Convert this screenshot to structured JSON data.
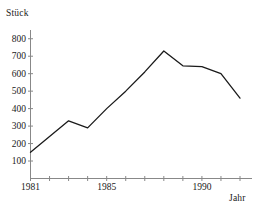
{
  "chart_data": {
    "type": "line",
    "title": "",
    "ylabel": "Stück",
    "xlabel": "Jahr",
    "x": [
      1981,
      1982,
      1983,
      1984,
      1985,
      1986,
      1987,
      1988,
      1989,
      1990,
      1991,
      1992
    ],
    "values": [
      150,
      240,
      330,
      290,
      400,
      500,
      610,
      730,
      645,
      640,
      600,
      460
    ],
    "series": [
      {
        "name": "Stück",
        "values": [
          150,
          240,
          330,
          290,
          400,
          500,
          610,
          730,
          645,
          640,
          600,
          460
        ]
      }
    ],
    "xlim": [
      1981,
      1992
    ],
    "ylim": [
      0,
      850
    ],
    "y_ticks": [
      100,
      200,
      300,
      400,
      500,
      600,
      700,
      800
    ],
    "y_tick_labels": [
      "100",
      "200",
      "300",
      "400",
      "500",
      "600",
      "700",
      "800"
    ],
    "x_ticks": [
      1981,
      1982,
      1983,
      1984,
      1985,
      1986,
      1987,
      1988,
      1989,
      1990,
      1991,
      1992
    ],
    "x_tick_labels": [
      {
        "value": 1981,
        "label": "1981"
      },
      {
        "value": 1985,
        "label": "1985"
      },
      {
        "value": 1990,
        "label": "1990"
      }
    ],
    "grid": false,
    "legend": "none",
    "line_color": "#1a1a1a",
    "axis_color": "#888888"
  }
}
